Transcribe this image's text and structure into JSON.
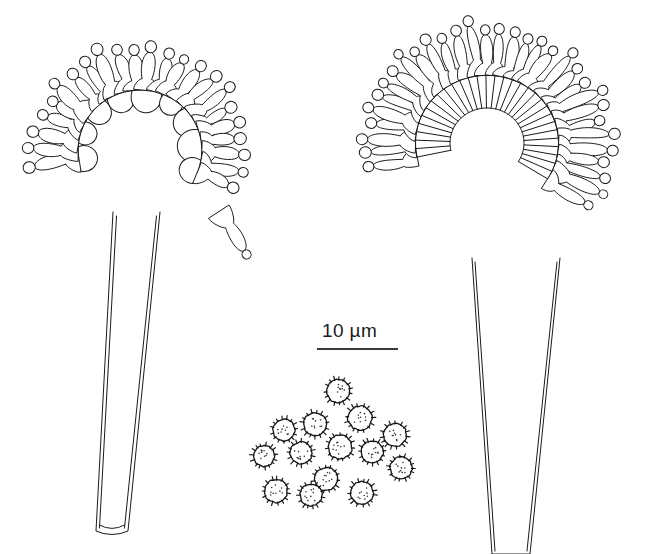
{
  "figure": {
    "title": "Fungal sporangiophore line drawing plate",
    "background_color": "#ffffff",
    "ink_color": "#1a1a1a",
    "width": 667,
    "height": 554
  },
  "scale_bar": {
    "label": "10 µm",
    "value": 10,
    "unit": "µm",
    "bar_x1": 317,
    "bar_x2": 398,
    "bar_y": 349,
    "label_x": 322,
    "label_y": 320,
    "color": "#3a3a3a"
  },
  "specimens": [
    {
      "name": "left-sporangiophore",
      "head": {
        "center_x": 140,
        "center_y": 150,
        "radius_x": 64,
        "radius_y": 62,
        "arc_start_deg": 171,
        "arc_end_deg": 382,
        "unit_count": 23,
        "vesicle_count": 9,
        "vesicle_radius": 15,
        "merosporangium_length": 40,
        "merosporangium_width": 13,
        "tip_radius": 5.2,
        "neck_ratio": 0.3
      },
      "stalk": {
        "top_left_x": 113,
        "top_right_x": 160,
        "top_y": 212,
        "bottom_left_x": 96,
        "bottom_right_x": 128,
        "bottom_y": 531,
        "inner_offset": 3.5,
        "has_base_cap": true
      },
      "extra_sporangium": {
        "base_x": 219,
        "base_y": 212,
        "tip_x": 243,
        "tip_y": 249,
        "width": 12,
        "tip_radius": 5
      }
    },
    {
      "name": "right-sporangiophore",
      "head": {
        "center_x": 487,
        "center_y": 143,
        "radius_x": 74,
        "radius_y": 70,
        "arc_start_deg": 168,
        "arc_end_deg": 392,
        "unit_count": 32,
        "vesicle_count": 0,
        "vesicle_radius": 0,
        "merosporangium_length": 46,
        "merosporangium_width": 12,
        "tip_radius": 5.0,
        "neck_ratio": 0.26
      },
      "stalk": {
        "top_left_x": 472,
        "top_right_x": 560,
        "top_y": 258,
        "bottom_left_x": 492,
        "bottom_right_x": 530,
        "bottom_y": 554,
        "inner_offset": 3.0,
        "has_base_cap": false
      },
      "extra_sporangium": null
    }
  ],
  "spore_cluster": {
    "name": "spore-cluster",
    "count": 14,
    "ornamentation": "echinulate",
    "spine_count": 15,
    "spine_length": 2.8,
    "interior_dots": 9,
    "spores": [
      {
        "cx": 338,
        "cy": 391,
        "r": 11.5,
        "rot": 12
      },
      {
        "cx": 315,
        "cy": 424,
        "r": 11.5,
        "rot": 40
      },
      {
        "cx": 360,
        "cy": 418,
        "r": 12.0,
        "rot": 70
      },
      {
        "cx": 284,
        "cy": 430,
        "r": 11.0,
        "rot": 22
      },
      {
        "cx": 395,
        "cy": 435,
        "r": 11.5,
        "rot": 55
      },
      {
        "cx": 301,
        "cy": 453,
        "r": 11.0,
        "rot": 84
      },
      {
        "cx": 340,
        "cy": 447,
        "r": 12.0,
        "rot": 30
      },
      {
        "cx": 264,
        "cy": 456,
        "r": 10.5,
        "rot": 63
      },
      {
        "cx": 372,
        "cy": 452,
        "r": 11.0,
        "rot": 15
      },
      {
        "cx": 401,
        "cy": 468,
        "r": 11.0,
        "rot": 48
      },
      {
        "cx": 326,
        "cy": 479,
        "r": 11.5,
        "rot": 77
      },
      {
        "cx": 276,
        "cy": 491,
        "r": 11.5,
        "rot": 36
      },
      {
        "cx": 311,
        "cy": 495,
        "r": 11.0,
        "rot": 8
      },
      {
        "cx": 362,
        "cy": 493,
        "r": 11.5,
        "rot": 60
      }
    ]
  }
}
